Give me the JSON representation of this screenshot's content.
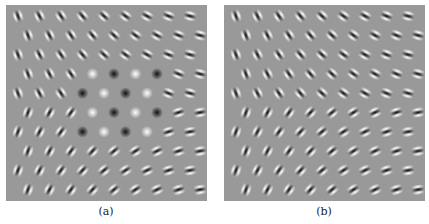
{
  "figure": {
    "panels": [
      {
        "id": "a",
        "label": "(a)",
        "description": "Grid of Gabor-like filters; orientation rotates from near-vertical (left) to horizontal (right), with center-surround blobs near the middle"
      },
      {
        "id": "b",
        "label": "(b)",
        "description": "Grid of Gabor-like filters; orientation rotates smoothly from near-vertical (left) to horizontal (right), no center-surround blobs"
      }
    ],
    "grid": {
      "rows": 10,
      "cols": 9
    },
    "colors": {
      "background": "#999999",
      "dark": "#111111",
      "light": "#ffffff",
      "page": "#ffffff"
    }
  }
}
